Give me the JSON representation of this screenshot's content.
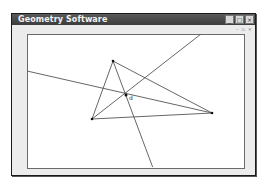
{
  "window": {
    "title": "Geometry Software",
    "buttons": {
      "minimize": "_",
      "maximize": "□",
      "close": "×"
    },
    "mdi_buttons": {
      "minimize": "-",
      "restore": "▫",
      "close": "×"
    }
  },
  "canvas": {
    "label": "d",
    "points": [
      {
        "name": "A",
        "x": 113,
        "y": 61
      },
      {
        "name": "B",
        "x": 92,
        "y": 119
      },
      {
        "name": "C",
        "x": 212,
        "y": 113
      },
      {
        "name": "center",
        "x": 126,
        "y": 95
      }
    ],
    "colors": {
      "line": "#555555",
      "point": "#111111",
      "titlebar": "#4a4a4a"
    }
  }
}
